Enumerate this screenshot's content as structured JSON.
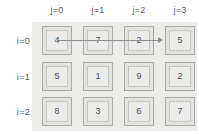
{
  "diagram": {
    "colors": {
      "panel": "#ececeb",
      "cell_outer": "#e3e3e2",
      "cell_inner": "#ebebea",
      "cell_border": "#a9a9a8",
      "text": "#4d4d4f",
      "label": "#58585a",
      "arrow": "#8c8c8c"
    },
    "column_headers": [
      {
        "label": "j=0"
      },
      {
        "label": "j=1"
      },
      {
        "label": "j=2"
      },
      {
        "label": "j=3"
      }
    ],
    "row_labels": [
      {
        "label": "i=0"
      },
      {
        "label": "i=1"
      },
      {
        "label": "i=2"
      }
    ],
    "rows": [
      {
        "cells": [
          {
            "value": "4"
          },
          {
            "value": "7"
          },
          {
            "value": "2"
          },
          {
            "value": "5"
          }
        ]
      },
      {
        "cells": [
          {
            "value": "5"
          },
          {
            "value": "1"
          },
          {
            "value": "9"
          },
          {
            "value": "2"
          }
        ]
      },
      {
        "cells": [
          {
            "value": "8"
          },
          {
            "value": "3"
          },
          {
            "value": "6"
          },
          {
            "value": "7"
          }
        ]
      }
    ],
    "arrow": {
      "name": "row-traversal-arrow",
      "from_row": "i=0",
      "from_col": "j=0",
      "to_row": "i=0",
      "to_col": "j=3",
      "direction": "right"
    }
  }
}
